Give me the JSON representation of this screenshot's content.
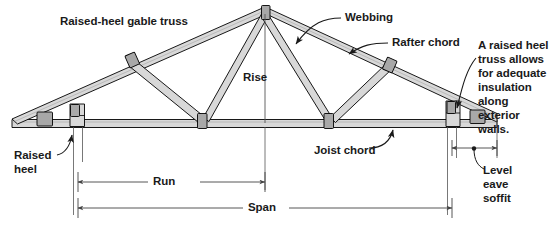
{
  "figure": {
    "title": "Raised-heel gable truss",
    "background_color": "#ffffff",
    "text_color": "#1a1a1a",
    "line_color": "#000000",
    "member_fill": "#d8d8d8",
    "plate_fill": "#a8a8a8",
    "dimension_line_color": "#555555"
  },
  "labels": {
    "title": "Raised-heel gable truss",
    "webbing": "Webbing",
    "rafter_chord": "Rafter chord",
    "rise": "Rise",
    "joist_chord": "Joist chord",
    "raised_heel": "Raised\nheel",
    "level_eave_soffit": "Level\neave\nsoffit",
    "note": "A raised heel\ntruss allows\nfor adequate\ninsulation along\nexterior walls.",
    "run": "Run",
    "span": "Span"
  },
  "dimensions": [
    {
      "name": "run",
      "label": "Run",
      "x_start": 78,
      "x_end": 265,
      "y": 182
    },
    {
      "name": "span",
      "label": "Span",
      "x_start": 78,
      "x_end": 452,
      "y": 208
    },
    {
      "name": "level-eave-soffit",
      "label": "Level eave soffit",
      "x_start": 452,
      "x_end": 497,
      "y": 148
    }
  ],
  "geometry": {
    "apex_x": 265,
    "apex_y": 12,
    "left_heel_x": 78,
    "right_heel_x": 452,
    "left_overhang_tip_x": 12,
    "right_overhang_tip_x": 497,
    "joist_chord_y": 123,
    "bottom_joint_left_x": 202,
    "bottom_joint_right_x": 328
  }
}
